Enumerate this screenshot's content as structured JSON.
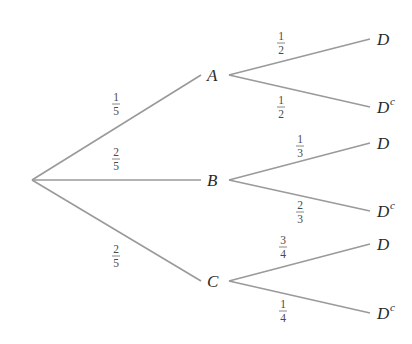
{
  "diagram": {
    "type": "probability-tree",
    "root": {
      "x": 32,
      "y": 180
    },
    "line_color": "#9a9a9a",
    "text_color": "#2a2a2a",
    "level1": [
      {
        "id": "A",
        "label": "A",
        "x": 212,
        "y": 75,
        "prob": {
          "num": "1",
          "den": "5"
        },
        "children": [
          {
            "label": "D",
            "sup": "",
            "y": 39,
            "prob": {
              "num": "1",
              "den": "2"
            }
          },
          {
            "label": "D",
            "sup": "c",
            "y": 107,
            "prob": {
              "num": "1",
              "den": "2"
            }
          }
        ]
      },
      {
        "id": "B",
        "label": "B",
        "x": 212,
        "y": 180,
        "prob": {
          "num": "2",
          "den": "5"
        },
        "children": [
          {
            "label": "D",
            "sup": "",
            "y": 143,
            "prob": {
              "num": "1",
              "den": "3"
            }
          },
          {
            "label": "D",
            "sup": "c",
            "y": 211,
            "prob": {
              "num": "2",
              "den": "3"
            }
          }
        ]
      },
      {
        "id": "C",
        "label": "C",
        "x": 212,
        "y": 281,
        "prob": {
          "num": "2",
          "den": "5"
        },
        "children": [
          {
            "label": "D",
            "sup": "",
            "y": 244,
            "prob": {
              "num": "3",
              "den": "4"
            }
          },
          {
            "label": "D",
            "sup": "c",
            "y": 313,
            "prob": {
              "num": "1",
              "den": "4"
            }
          }
        ]
      }
    ]
  }
}
